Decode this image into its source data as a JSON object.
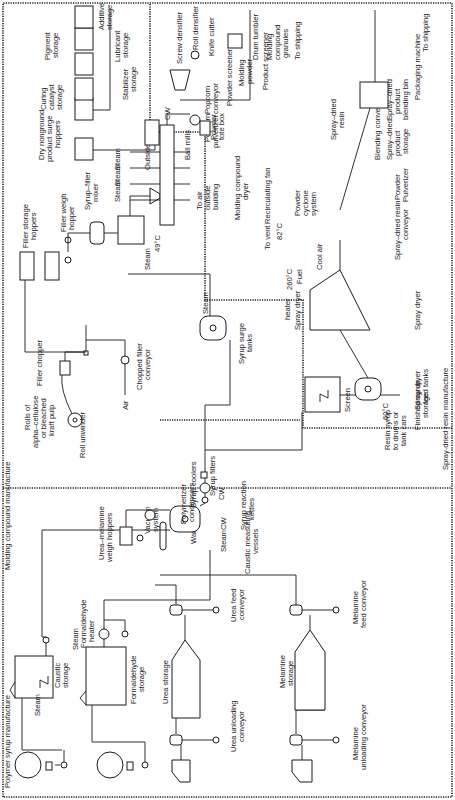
{
  "diagram": {
    "orientation": "rotated 90 degrees counter-clockwise",
    "colors": {
      "ink": "#1a1a1a",
      "background": "#ffffff"
    },
    "sections": {
      "polymer_syrup": "Polymer syrup manufacture",
      "molding_compound": "Molding compound manufacture",
      "spray_dried_resin": "Spray-dried resin manufacture"
    },
    "labels": {
      "melamine_unloading_conveyor": [
        "Melamine",
        "unloading conveyor"
      ],
      "urea_unloading_conveyor": [
        "Urea unloading",
        "conveyor"
      ],
      "melamine_storage": [
        "Melamine",
        "storage"
      ],
      "urea_storage": "Urea storage",
      "melamine_feed_conveyor": [
        "Melamine",
        "feed conveyor"
      ],
      "urea_feed_conveyor": [
        "Urea feed",
        "conveyor"
      ],
      "caustic_storage": [
        "Caustic",
        "storage"
      ],
      "formaldehyde_storage": [
        "Formaldehyde",
        "storage"
      ],
      "formaldehyde_heater": [
        "Formaldehyde",
        "heater"
      ],
      "steam": "Steam",
      "water": "Water",
      "caustic_measuring_vessels": [
        "Caustic measuring",
        "vessels"
      ],
      "syrup_reaction_kettles": [
        "Syrup reaction",
        "kettles"
      ],
      "urea_melamine_weigh_hoppers": [
        "Urea–melamine",
        "weigh hoppers"
      ],
      "vacuum_system": [
        "Vacuum",
        "system"
      ],
      "polymerizer_condensers": [
        "Polymerizer",
        "condensers"
      ],
      "cw": "CW",
      "syrup_coolers": "Syrup coolers",
      "syrup_filters": "Syrup filters",
      "screen": "Screen",
      "resin_syrup_out": [
        "Resin syrup",
        "to drums or",
        "tank cars"
      ],
      "finished_syrup_storage": [
        "Finished syrup",
        "storage"
      ],
      "syrup_surge_tanks": [
        "Syrup surge",
        "tanks"
      ],
      "rolls_alpha_cellulose": [
        "Rolls of",
        "alpha–cellulose",
        "or bleached",
        "kraft pulp"
      ],
      "roll_unwinder": "Roll unwinder",
      "filler_chopper": "Filler chopper",
      "air": "Air",
      "chopped_filler_conveyor": [
        "Chopped filler",
        "conveyor"
      ],
      "filler_storage_hoppers": [
        "Filler storage",
        "hoppers"
      ],
      "filler_weigh_hopper": [
        "Filler weigh",
        "hopper"
      ],
      "syrup_filler_mixer": [
        "Syrup–filler",
        "mixer"
      ],
      "temp_49": "49°C",
      "outside_air": "Outside air",
      "to_air_outside_building": [
        "To air",
        "outside",
        "building"
      ],
      "molding_compound_dryer": [
        "Molding compound",
        "dryer"
      ],
      "popcorn_pulverizer": [
        "Popcorn",
        "pulverizer"
      ],
      "popcorn_conveyor": [
        "Popcorn",
        "conveyor"
      ],
      "powder_screener": "Powder screener",
      "molding_powder": [
        "Molding",
        "powder"
      ],
      "dry_nonground_surge_hoppers": [
        "Dry nonground",
        "product surge",
        "hoppers"
      ],
      "curing_catalyst_storage": [
        "Curing",
        "catalyst",
        "storage"
      ],
      "stabilizer_storage": [
        "Stabilizer",
        "storage"
      ],
      "pigment_storage": [
        "Pigment",
        "storage"
      ],
      "lubricant_storage": [
        "Lubricant",
        "storage"
      ],
      "additive_storage": [
        "Additive",
        "storage"
      ],
      "ball_mills": "Ball mills",
      "powder_tote_box": [
        "Powder",
        "tote box"
      ],
      "screw_densifier": "Screw densifier",
      "roll_densifier": "Roll densifier",
      "knife_cutter": "Knife cutter",
      "drum_tumbler": "Drum tumbler",
      "molding_compound_granules": [
        "Molding",
        "compound",
        "granules"
      ],
      "to_shipping": "To shipping",
      "product_screener": "Product screener",
      "spray_dried_resin": [
        "Spray–dried",
        "resin"
      ],
      "packaging_machine": "Packaging machine",
      "spray_dryer_feed_tanks": [
        "Spray dryer",
        "feed tanks"
      ],
      "temp_60": "60°C",
      "spray_dryer": "Spray dryer",
      "spray_dryer_heater": [
        "Spray dryer",
        "heater"
      ],
      "temp_260": "260°C",
      "fuel": "Fuel",
      "cool_air": "Cool air",
      "to_vent": "To vent",
      "temp_82": "82°C",
      "recirculating_fan": "Recirculating fan",
      "powder_cyclone_system": [
        "Powder",
        "cyclone",
        "system"
      ],
      "spray_dried_resin_conveyor": [
        "Spray–dried resin",
        "conveyor"
      ],
      "powder_pulverizer": [
        "Powder",
        "Pulverizer"
      ],
      "spray_dried_product_storage": [
        "Spray–dried",
        "product",
        "storage"
      ],
      "blending_conveyor": "Blending conveyor",
      "spray_dried_product_blending_bin": [
        "Spray–dried",
        "product",
        "blending bin"
      ]
    }
  }
}
